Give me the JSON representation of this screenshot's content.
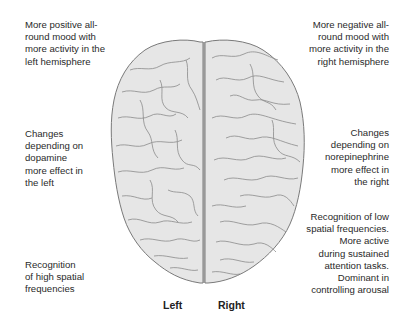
{
  "diagram": {
    "colors": {
      "brain_fill": "#e6e6e6",
      "brain_outline": "#7a7a7a",
      "gyri_lines": "#8a8a8a",
      "text": "#2a2a2a"
    },
    "left_notes": [
      {
        "id": "mood",
        "text": "More positive all-\nround mood with\nmore activity in the\nleft hemisphere"
      },
      {
        "id": "neurotransmitter",
        "text": "Changes\ndepending on\ndopamine\nmore effect in\nthe left"
      },
      {
        "id": "spatial",
        "text": "Recognition\nof high spatial\nfrequencies"
      }
    ],
    "right_notes": [
      {
        "id": "mood",
        "text": "More negative all-\nround mood with\nmore activity in the\nright hemisphere"
      },
      {
        "id": "neurotransmitter",
        "text": "Changes\ndepending on\nnorepinephrine\nmore effect in\nthe right"
      },
      {
        "id": "spatial",
        "text": "Recognition of low\nspatial frequencies.\nMore active\nduring sustained\nattention tasks.\nDominant in\ncontrolling arousal"
      }
    ],
    "hemisphere_labels": {
      "left": "Left",
      "right": "Right"
    }
  }
}
